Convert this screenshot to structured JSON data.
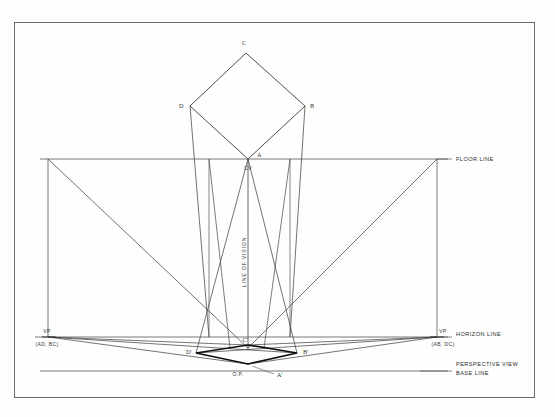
{
  "drawing": {
    "title_domain": "two-point perspective construction",
    "frame": {
      "x": 14,
      "y": 22,
      "width": 521,
      "height": 376
    },
    "colors": {
      "paper": "#fefefe",
      "line": "#3a3a3a",
      "thin_line": "#555555",
      "heavy_line": "#111111",
      "text": "#2b2b2b"
    },
    "reference_lines": [
      {
        "name": "floor-line",
        "label": "FLOOR LINE",
        "y": 159,
        "x1": 40,
        "x2": 448,
        "label_x": 455,
        "label_y": 160
      },
      {
        "name": "horizon-line",
        "label": "HORIZON LINE",
        "y": 337,
        "x1": 35,
        "x2": 448,
        "label_x": 455,
        "label_y": 336
      },
      {
        "name": "base-line",
        "label": "PERSPECTIVE VIEW\nBASE LINE",
        "label_line1": "PERSPECTIVE VIEW",
        "label_line2": "BASE LINE",
        "y": 371,
        "x1": 40,
        "x2": 448,
        "label_x": 455,
        "label_y": 368
      }
    ],
    "plan_square": {
      "name": "plan-view-square",
      "vertices": [
        {
          "label": "C",
          "x": 246,
          "y": 53,
          "label_x": 244,
          "label_y": 45
        },
        {
          "label": "B",
          "x": 305,
          "y": 106,
          "label_x": 310,
          "label_y": 106
        },
        {
          "label": "A",
          "x": 248,
          "y": 159,
          "label_x": 257,
          "label_y": 156
        },
        {
          "label": "D",
          "x": 190,
          "y": 106,
          "label_x": 179,
          "label_y": 106
        }
      ]
    },
    "station_point": {
      "name": "station-point",
      "label": "CV",
      "x": 248,
      "y": 159,
      "label_x": 242,
      "label_y": 171
    },
    "line_of_vision": {
      "name": "line-of-vision",
      "label": "LINE OF VISION",
      "x": 248,
      "y1": 159,
      "y2": 348,
      "text_x": 246,
      "text_y": 262
    },
    "vanishing_points": [
      {
        "name": "vp-left",
        "label": "VP",
        "sublabel": "(AD, BC)",
        "x": 48,
        "y": 337,
        "label_x": 43,
        "label_y": 333,
        "sub_x": 29,
        "sub_y": 345
      },
      {
        "name": "vp-right",
        "label": "VP",
        "sublabel": "(AB, DC)",
        "x": 437,
        "y": 337,
        "label_x": 439,
        "label_y": 333,
        "sub_x": 424,
        "sub_y": 345
      }
    ],
    "perspective_view": {
      "name": "perspective-quadrilateral",
      "vertices": [
        {
          "label": "C'",
          "x": 248,
          "y": 345,
          "label_x": 244,
          "label_y": 342
        },
        {
          "label": "B'",
          "x": 297,
          "y": 353,
          "label_x": 303,
          "label_y": 352
        },
        {
          "label": "A'",
          "x": 248,
          "y": 364,
          "label_x": 277,
          "label_y": 371
        },
        {
          "label": "D'",
          "x": 196,
          "y": 353,
          "label_x": 187,
          "label_y": 352
        }
      ],
      "origin_point": {
        "label": "O.P.",
        "x": 248,
        "y": 364,
        "label_x": 230,
        "label_y": 373
      }
    },
    "verticals": [
      {
        "name": "vertical-left-edge",
        "x": 48,
        "y1": 159,
        "y2": 337
      },
      {
        "name": "vertical-right-edge",
        "x": 437,
        "y1": 159,
        "y2": 337
      },
      {
        "name": "vertical-through-D",
        "x": 209,
        "y1": 159,
        "y2": 337
      },
      {
        "name": "vertical-through-CV",
        "x": 248,
        "y1": 159,
        "y2": 348
      },
      {
        "name": "vertical-through-B",
        "x": 290,
        "y1": 159,
        "y2": 337
      }
    ]
  }
}
